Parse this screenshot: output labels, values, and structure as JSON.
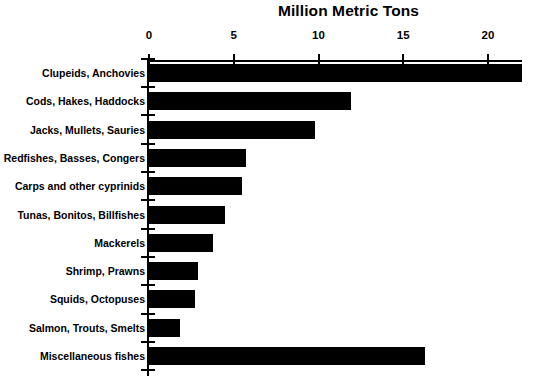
{
  "chart_data": {
    "type": "bar",
    "orientation": "horizontal",
    "title": "Million Metric Tons",
    "xlabel": "",
    "ylabel": "",
    "xlim": [
      0,
      22.5
    ],
    "xticks": [
      0,
      5,
      10,
      15,
      20
    ],
    "xtick_labels": [
      "0",
      "5",
      "10",
      "15",
      "20"
    ],
    "grid": false,
    "legend": null,
    "bar_color": "#000000",
    "background_color": "#ffffff",
    "categories": [
      "Clupeids, Anchovies",
      "Cods, Hakes, Haddocks",
      "Jacks, Mullets, Sauries",
      "Redfishes, Basses, Congers",
      "Carps and other cyprinids",
      "Tunas, Bonitos, Billfishes",
      "Mackerels",
      "Shrimp, Prawns",
      "Squids, Octopuses",
      "Salmon, Trouts, Smelts",
      "Miscellaneous fishes"
    ],
    "values": [
      22.0,
      11.9,
      9.8,
      5.7,
      5.5,
      4.5,
      3.8,
      2.9,
      2.7,
      1.8,
      16.3
    ]
  }
}
